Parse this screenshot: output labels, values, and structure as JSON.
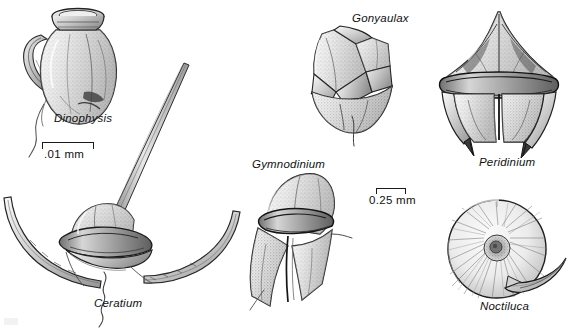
{
  "figure": {
    "kind": "scientific-illustration-plate",
    "background_color": "#ffffff",
    "ink_color": "#1b1b1b"
  },
  "organisms": [
    {
      "name": "Dinophysis",
      "label": "Dinophysis",
      "label_x": 54,
      "label_y": 112,
      "description": "urn-shaped cell with flared apical collar, lateral sagittal list and trailing flagellum"
    },
    {
      "name": "Ceratium",
      "label": "Ceratium",
      "label_x": 94,
      "label_y": 297,
      "description": "cell with one long apical horn and two curved antapical horns"
    },
    {
      "name": "Gonyaulax",
      "label": "Gonyaulax",
      "label_x": 352,
      "label_y": 12,
      "description": "angular armoured cell with distinct thecal plates and trailing flagellum"
    },
    {
      "name": "Gymnodinium",
      "label": "Gymnodinium",
      "label_x": 252,
      "label_y": 158,
      "description": "unarmoured cell with rounded epicone and deep cingulum groove"
    },
    {
      "name": "Peridinium",
      "label": "Peridinium",
      "label_x": 479,
      "label_y": 156,
      "description": "armoured cell with apical horn, girdle and two antapical spines"
    },
    {
      "name": "Noctiluca",
      "label": "Noctiluca",
      "label_x": 480,
      "label_y": 300,
      "description": "large spherical cell with radial striations and a stout curved tentacle"
    }
  ],
  "scale_bars": [
    {
      "name": "scale-bar-dinophysis",
      "text": ".01 mm",
      "bar_x": 42,
      "bar_y": 142,
      "bar_width": 52,
      "label_x": 44,
      "label_y": 148
    },
    {
      "name": "scale-bar-lower",
      "text": "0.25 mm",
      "bar_x": 376,
      "bar_y": 188,
      "bar_width": 30,
      "label_x": 369,
      "label_y": 194
    }
  ]
}
